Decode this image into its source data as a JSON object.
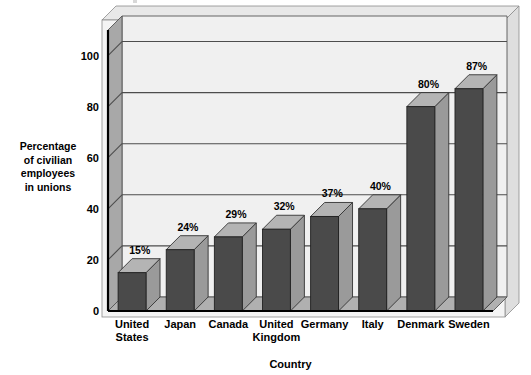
{
  "chart_data": {
    "type": "bar",
    "title": "",
    "subtitle": "",
    "xlabel": "Country",
    "ylabel": "Percentage of civilian employees in unions",
    "ylabel_lines": [
      "Percentage",
      "of civilian",
      "employees",
      "in unions"
    ],
    "categories": [
      "United States",
      "Japan",
      "Canada",
      "United Kingdom",
      "Germany",
      "Italy",
      "Denmark",
      "Sweden"
    ],
    "category_lines": [
      [
        "United",
        "States"
      ],
      [
        "Japan"
      ],
      [
        "Canada"
      ],
      [
        "United",
        "Kingdom"
      ],
      [
        "Germany"
      ],
      [
        "Italy"
      ],
      [
        "Denmark"
      ],
      [
        "Sweden"
      ]
    ],
    "values": [
      15,
      24,
      29,
      32,
      37,
      40,
      80,
      87
    ],
    "data_labels": [
      "15%",
      "24%",
      "29%",
      "32%",
      "37%",
      "40%",
      "80%",
      "87%"
    ],
    "ylim": [
      0,
      110
    ],
    "yticks": [
      0,
      20,
      40,
      60,
      80,
      100
    ],
    "ytick_labels": [
      "0",
      "20",
      "40",
      "60",
      "80",
      "100"
    ],
    "grid": true,
    "grid_axis": "y",
    "legend": "none",
    "style": "3d-column",
    "colors": {
      "bar_front": "#4a4a4a",
      "bar_top": "#b4b4b4",
      "bar_side": "#9a9a9a",
      "plot_back_wall": "#f0f0f0",
      "plot_left_wall": "#a8a8a8",
      "plot_floor": "#b0b0b0",
      "outer_frame": "#e8e8e8",
      "gridline": "#4d4d4d",
      "axis_line": "#000000",
      "text": "#000000",
      "page_background": "#ffffff"
    }
  }
}
